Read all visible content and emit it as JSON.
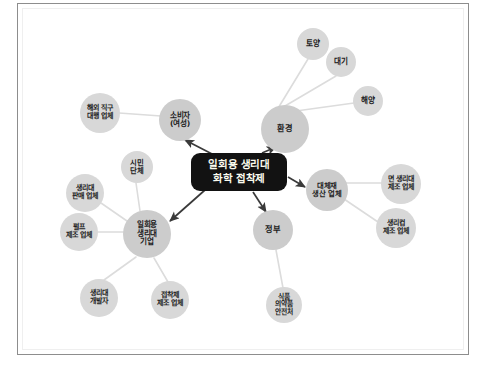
{
  "page": {
    "width": 487,
    "height": 376,
    "background": "#ffffff",
    "top_clipped_text": "",
    "frame_border_color": "#8d8d8d"
  },
  "diagram": {
    "type": "stakeholder-network",
    "center": {
      "id": "center",
      "line1": "일회용 생리대",
      "line2": "화학 접착제",
      "x": 239,
      "y": 172,
      "width": 96,
      "height": 38,
      "fill": "#121212",
      "text_color": "#fbfbee",
      "font_size": 10.5
    },
    "hub_color": "#cccccc",
    "leaf_color": "#d8d8d8",
    "edge_color": "#dcdcdc",
    "arrow_color": "#3a3a3a",
    "hubs": [
      {
        "id": "consumer",
        "label": "소비자\n(여성)",
        "x": 180,
        "y": 120,
        "r": 21,
        "font_size": 7.6
      },
      {
        "id": "environment",
        "label": "환경",
        "x": 285,
        "y": 129,
        "r": 24,
        "font_size": 8.2
      },
      {
        "id": "company",
        "label": "일회용\n생리대\n기업",
        "x": 147,
        "y": 234,
        "r": 24,
        "font_size": 7.6
      },
      {
        "id": "alternative",
        "label": "대체재\n생산 업체",
        "x": 327,
        "y": 190,
        "r": 21,
        "font_size": 7.4
      },
      {
        "id": "government",
        "label": "정부",
        "x": 273,
        "y": 230,
        "r": 20,
        "font_size": 8.2
      }
    ],
    "leaves": [
      {
        "id": "overseas-agent",
        "label": "해외 직구\n대행 업체",
        "x": 100,
        "y": 113,
        "r": 20,
        "font_size": 7.0,
        "parent": "consumer"
      },
      {
        "id": "soil",
        "label": "토양",
        "x": 313,
        "y": 44,
        "r": 16,
        "font_size": 7.6,
        "parent": "environment"
      },
      {
        "id": "air",
        "label": "대기",
        "x": 341,
        "y": 62,
        "r": 15,
        "font_size": 7.6,
        "parent": "environment"
      },
      {
        "id": "ocean",
        "label": "해양",
        "x": 368,
        "y": 101,
        "r": 15,
        "font_size": 7.6,
        "parent": "environment"
      },
      {
        "id": "cotton-pad-maker",
        "label": "면 생리대\n제조 업체",
        "x": 401,
        "y": 184,
        "r": 20,
        "font_size": 7.0,
        "parent": "alternative"
      },
      {
        "id": "cup-maker",
        "label": "생리컵\n제조 업체",
        "x": 396,
        "y": 228,
        "r": 20,
        "font_size": 7.0,
        "parent": "alternative"
      },
      {
        "id": "mfds",
        "label": "식품\n의약품\n안전처",
        "x": 284,
        "y": 305,
        "r": 18,
        "font_size": 6.8,
        "parent": "government"
      },
      {
        "id": "civic-group",
        "label": "시민\n단체",
        "x": 137,
        "y": 167,
        "r": 16,
        "font_size": 7.4,
        "parent": "company"
      },
      {
        "id": "pad-seller",
        "label": "생리대\n판매 업체",
        "x": 85,
        "y": 193,
        "r": 19,
        "font_size": 7.0,
        "parent": "company"
      },
      {
        "id": "pulp-maker",
        "label": "펄프\n제조 업체",
        "x": 79,
        "y": 232,
        "r": 19,
        "font_size": 7.0,
        "parent": "company"
      },
      {
        "id": "pad-developer",
        "label": "생리대\n개발자",
        "x": 99,
        "y": 298,
        "r": 19,
        "font_size": 7.0,
        "parent": "company"
      },
      {
        "id": "adhesive-maker",
        "label": "접착제\n제조 업체",
        "x": 170,
        "y": 300,
        "r": 19,
        "font_size": 7.0,
        "parent": "company"
      }
    ],
    "arrows": [
      {
        "id": "arrow-to-consumer",
        "from": "center",
        "to": "consumer",
        "x1": 214,
        "y1": 155,
        "x2": 185,
        "y2": 140
      },
      {
        "id": "arrow-to-environment",
        "from": "center",
        "to": "environment",
        "x1": 262,
        "y1": 153,
        "x2": 276,
        "y2": 147
      },
      {
        "id": "arrow-to-alternative",
        "from": "center",
        "to": "alternative",
        "x1": 288,
        "y1": 177,
        "x2": 305,
        "y2": 187
      },
      {
        "id": "arrow-to-company",
        "from": "center",
        "to": "company",
        "x1": 205,
        "y1": 190,
        "x2": 170,
        "y2": 221
      },
      {
        "id": "arrow-to-government",
        "from": "center",
        "to": "government",
        "x1": 253,
        "y1": 192,
        "x2": 266,
        "y2": 212
      }
    ],
    "edges": [
      {
        "id": "edge-consumer-overseas",
        "x1": 161,
        "y1": 116,
        "x2": 119,
        "y2": 113
      },
      {
        "id": "edge-environment-soil",
        "x1": 277,
        "y1": 110,
        "x2": 308,
        "y2": 59
      },
      {
        "id": "edge-environment-air",
        "x1": 285,
        "y1": 106,
        "x2": 336,
        "y2": 76
      },
      {
        "id": "edge-environment-ocean",
        "x1": 296,
        "y1": 111,
        "x2": 354,
        "y2": 103
      },
      {
        "id": "edge-alt-cotton",
        "x1": 346,
        "y1": 183,
        "x2": 382,
        "y2": 183
      },
      {
        "id": "edge-alt-cup",
        "x1": 344,
        "y1": 199,
        "x2": 378,
        "y2": 222
      },
      {
        "id": "edge-gov-mfds",
        "x1": 276,
        "y1": 250,
        "x2": 283,
        "y2": 288
      },
      {
        "id": "edge-company-civic",
        "x1": 140,
        "y1": 211,
        "x2": 136,
        "y2": 183
      },
      {
        "id": "edge-company-seller",
        "x1": 127,
        "y1": 221,
        "x2": 101,
        "y2": 203
      },
      {
        "id": "edge-company-pulp",
        "x1": 124,
        "y1": 232,
        "x2": 98,
        "y2": 232
      },
      {
        "id": "edge-company-developer",
        "x1": 136,
        "y1": 257,
        "x2": 104,
        "y2": 280
      },
      {
        "id": "edge-company-adhesive",
        "x1": 154,
        "y1": 258,
        "x2": 168,
        "y2": 282
      }
    ]
  }
}
